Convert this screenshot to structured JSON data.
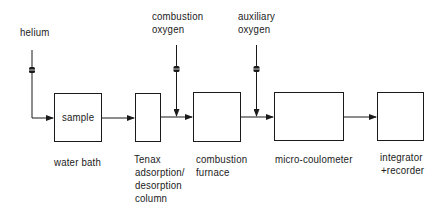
{
  "diagram": {
    "inputs": {
      "helium": "helium",
      "combustion_oxygen": [
        "combustion",
        "oxygen"
      ],
      "auxiliary_oxygen": [
        "auxiliary",
        "oxygen"
      ]
    },
    "boxes": [
      {
        "id": "sample",
        "inner_label": "sample",
        "caption": [
          "water bath"
        ]
      },
      {
        "id": "tenax",
        "inner_label": "",
        "caption": [
          "Tenax",
          "adsorption/",
          "desorption",
          "column"
        ]
      },
      {
        "id": "furnace",
        "inner_label": "",
        "caption": [
          "combustion",
          "furnace"
        ]
      },
      {
        "id": "coulometer",
        "inner_label": "",
        "caption": [
          "micro-coulometer"
        ]
      },
      {
        "id": "integrator",
        "inner_label": "",
        "caption": [
          "integrator",
          "+recorder"
        ]
      }
    ],
    "icons": {
      "valve": "valve-icon",
      "arrow": "arrow-right-icon"
    },
    "colors": {
      "line": "#1a1a1a",
      "background": "#ffffff"
    }
  }
}
